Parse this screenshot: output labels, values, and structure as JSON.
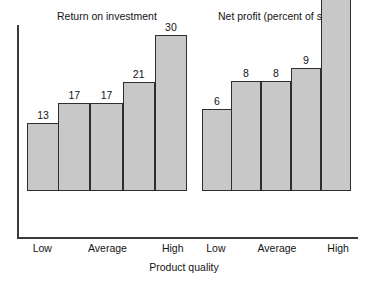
{
  "chart_data": {
    "type": "bar",
    "title": "",
    "xlabel": "Product quality",
    "ylabel": "",
    "grid": false,
    "legend": "none",
    "orientation": "vertical",
    "panels": [
      {
        "title": "Return on investment",
        "categories": [
          "Low",
          "",
          "Average",
          "",
          "High"
        ],
        "values": [
          13,
          17,
          17,
          21,
          30
        ],
        "ylim": [
          0,
          30
        ],
        "px_per_unit": 5.2
      },
      {
        "title": "Net profit (percent of sales)",
        "categories": [
          "Low",
          "",
          "Average",
          "",
          "High"
        ],
        "values": [
          6,
          8,
          8,
          9,
          14
        ],
        "ylim": [
          0,
          14
        ],
        "px_per_unit": 13.7
      }
    ]
  },
  "axes": {
    "x_title": "Product quality"
  },
  "style": {
    "bar_fill": "#c8c8c8",
    "bar_stroke": "#2e2e2e",
    "axis_color": "#3a3a3a",
    "text_color": "#141414",
    "background": "#ffffff"
  }
}
